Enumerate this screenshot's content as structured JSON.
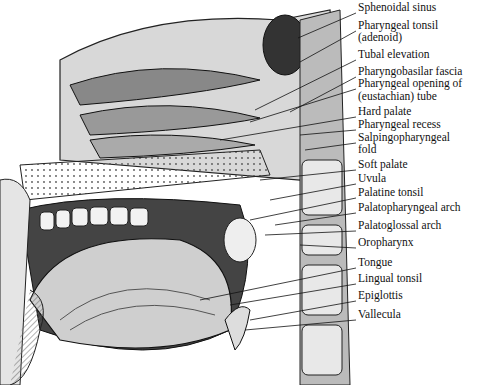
{
  "figure": {
    "labels": [
      {
        "text": "Sphenoidal sinus",
        "y": 7,
        "tx": 298,
        "ty": 38
      },
      {
        "text": "Pharyngeal tonsil",
        "y": 25,
        "tx": 300,
        "ty": 62
      },
      {
        "text": "(adenoid)",
        "y": 37,
        "tx": null,
        "ty": null
      },
      {
        "text": "Tubal elevation",
        "y": 54,
        "tx": 255,
        "ty": 110
      },
      {
        "text": "Pharyngobasilar fascia",
        "y": 71,
        "tx": 290,
        "ty": 112
      },
      {
        "text": "Pharyngeal opening of",
        "y": 83,
        "tx": 250,
        "ty": 122
      },
      {
        "text": "(eustachian) tube",
        "y": 96,
        "tx": null,
        "ty": null
      },
      {
        "text": "Hard palate",
        "y": 111,
        "tx": 220,
        "ty": 140
      },
      {
        "text": "Pharyngeal recess",
        "y": 124,
        "tx": 300,
        "ty": 135
      },
      {
        "text": "Salpingopharyngeal",
        "y": 137,
        "tx": 305,
        "ty": 150
      },
      {
        "text": "fold",
        "y": 149,
        "tx": null,
        "ty": null
      },
      {
        "text": "Soft palate",
        "y": 164,
        "tx": 260,
        "ty": 180
      },
      {
        "text": "Uvula",
        "y": 178,
        "tx": 270,
        "ty": 200
      },
      {
        "text": "Palatine tonsil",
        "y": 192,
        "tx": 250,
        "ty": 220
      },
      {
        "text": "Palatopharyngeal arch",
        "y": 207,
        "tx": 275,
        "ty": 225
      },
      {
        "text": "Palatoglossal arch",
        "y": 225,
        "tx": 265,
        "ty": 235
      },
      {
        "text": "Oropharynx",
        "y": 242,
        "tx": 300,
        "ty": 245
      },
      {
        "text": "Tongue",
        "y": 262,
        "tx": 200,
        "ty": 300
      },
      {
        "text": "Lingual tonsil",
        "y": 278,
        "tx": 230,
        "ty": 305
      },
      {
        "text": "Epiglottis",
        "y": 295,
        "tx": 250,
        "ty": 320
      },
      {
        "text": "Vallecula",
        "y": 314,
        "tx": 245,
        "ty": 330
      }
    ]
  }
}
